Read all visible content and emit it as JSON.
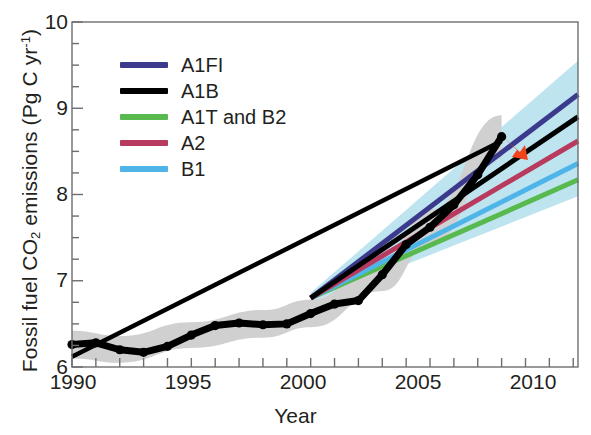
{
  "chart_data": {
    "type": "line",
    "title": "",
    "xlabel": "Year",
    "ylabel": "Fossil fuel CO2 emissions (Pg C yr-1)",
    "ylabel_parts": {
      "prefix": "Fossil fuel CO",
      "sub1": "2",
      "middle": " emissions (Pg C yr",
      "sup1": "-1",
      "suffix": ")"
    },
    "xlim": [
      1990,
      2011.2
    ],
    "ylim": [
      6,
      10
    ],
    "grid": false,
    "legend_position": "upper-left",
    "xticks_labeled": [
      "1990",
      "1995",
      "2000",
      "2005",
      "2010"
    ],
    "xtick_values": [
      1990,
      1995,
      2000,
      2005,
      2010
    ],
    "xtick_minor_step": 1,
    "yticks_labeled": [
      "6",
      "7",
      "8",
      "9",
      "10"
    ],
    "ytick_values": [
      6,
      7,
      8,
      9,
      10
    ],
    "ytick_minor_step": 0.25,
    "colors": {
      "A1FI": "#3b3a8c",
      "A1B": "#000000",
      "A1T_and_B2": "#57b94e",
      "A2": "#b83a5e",
      "B1": "#4fb4e8",
      "observed": "#000000",
      "observed_band": "#d0d0d0",
      "projection_band": "#bde4ef",
      "arrow": "#f0431a"
    },
    "legend": [
      {
        "label": "A1FI",
        "color": "#3b3a8c"
      },
      {
        "label": "A1B",
        "color": "#000000"
      },
      {
        "label": "A1T and B2",
        "color": "#57b94e"
      },
      {
        "label": "A2",
        "color": "#b83a5e"
      },
      {
        "label": "B1",
        "color": "#4fb4e8"
      }
    ],
    "series": [
      {
        "name": "Observed emissions",
        "style": "thick-black-with-markers",
        "color": "#000000",
        "x": [
          1990,
          1991,
          1992,
          1993,
          1994,
          1995,
          1996,
          1997,
          1998,
          1999,
          2000,
          2001,
          2002,
          2003,
          2004,
          2005,
          2006,
          2007,
          2008
        ],
        "values": [
          6.26,
          6.28,
          6.2,
          6.17,
          6.24,
          6.37,
          6.48,
          6.51,
          6.49,
          6.5,
          6.62,
          6.73,
          6.77,
          7.07,
          7.42,
          7.62,
          7.88,
          8.23,
          8.67
        ]
      },
      {
        "name": "Observed uncertainty band",
        "style": "band",
        "color": "#d0d0d0",
        "x": [
          1990,
          1992,
          1995,
          1998,
          2000,
          2003,
          2005,
          2008
        ],
        "lower": [
          6.1,
          6.05,
          6.22,
          6.34,
          6.46,
          6.88,
          7.42,
          8.42
        ],
        "upper": [
          6.42,
          6.36,
          6.52,
          6.66,
          6.78,
          7.26,
          7.82,
          8.92
        ]
      },
      {
        "name": "Observed trend line",
        "style": "thin-black-straight",
        "color": "#000000",
        "x": [
          1990,
          2008
        ],
        "values": [
          6.12,
          8.62
        ]
      },
      {
        "name": "A1FI",
        "style": "scenario",
        "color": "#3b3a8c",
        "x": [
          2000,
          2011.2
        ],
        "values": [
          6.8,
          9.16
        ]
      },
      {
        "name": "A1B",
        "style": "scenario",
        "color": "#000000",
        "x": [
          2000,
          2011.2
        ],
        "values": [
          6.8,
          8.9
        ]
      },
      {
        "name": "A2",
        "style": "scenario",
        "color": "#b83a5e",
        "x": [
          2000,
          2011.2
        ],
        "values": [
          6.8,
          8.62
        ]
      },
      {
        "name": "B1",
        "style": "scenario",
        "color": "#4fb4e8",
        "x": [
          2000,
          2011.2
        ],
        "values": [
          6.8,
          8.36
        ]
      },
      {
        "name": "A1T and B2",
        "style": "scenario",
        "color": "#57b94e",
        "x": [
          2000,
          2011.2
        ],
        "values": [
          6.8,
          8.17
        ]
      },
      {
        "name": "Projection uncertainty band",
        "style": "band",
        "color": "#bde4ef",
        "x": [
          2000,
          2011.2
        ],
        "lower": [
          6.75,
          7.98
        ],
        "upper": [
          6.86,
          9.55
        ]
      }
    ],
    "annotations": [
      {
        "name": "red-arrow",
        "x": 2008.6,
        "y": 8.55,
        "color": "#f0431a",
        "text": ""
      }
    ]
  }
}
